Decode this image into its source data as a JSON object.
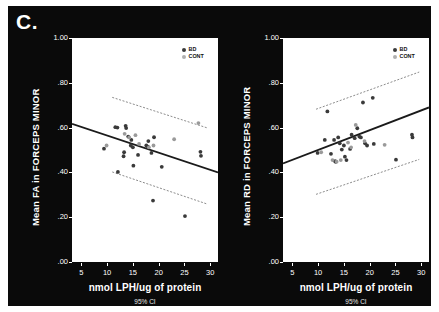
{
  "figure": {
    "panel_letter": "C.",
    "background": "#0a0a0a",
    "plot_background": "#ffffff"
  },
  "legend": {
    "items": [
      {
        "label": "BD",
        "color": "#3a3a3a"
      },
      {
        "label": "CONT",
        "color": "#b0b0b0"
      }
    ]
  },
  "chart_data": [
    {
      "type": "scatter",
      "title": "",
      "xlabel": "nmol LPH/ug of protein",
      "ylabel": "Mean FA in FORCEPS  MINOR",
      "footnote": "95% CI",
      "xlim": [
        3.2,
        31.5
      ],
      "ylim": [
        0.0,
        1.0
      ],
      "xticks": [
        5,
        10,
        15,
        20,
        25,
        30
      ],
      "xticklabels": [
        "5",
        "10",
        "15",
        "20",
        "25",
        "30"
      ],
      "yticks": [
        0.0,
        0.2,
        0.4,
        0.6,
        0.8,
        1.0
      ],
      "yticklabels": [
        ".00",
        ".20",
        ".40",
        ".60",
        ".80",
        "1.00"
      ],
      "grid": false,
      "legend_position": "top-right",
      "fit_line": {
        "x": [
          3.2,
          31.5
        ],
        "y": [
          0.617,
          0.4
        ],
        "color": "#1a1a1a"
      },
      "ci_upper": {
        "x": [
          11.0,
          29.5
        ],
        "y": [
          0.735,
          0.598
        ],
        "color": "#6e6e6e"
      },
      "ci_lower": {
        "x": [
          11.0,
          29.5
        ],
        "y": [
          0.402,
          0.258
        ],
        "color": "#6e6e6e"
      },
      "series": [
        {
          "name": "BD",
          "color": "#3a3a3a",
          "points": [
            [
              9.4,
              0.506
            ],
            [
              11.6,
              0.602
            ],
            [
              12.0,
              0.6
            ],
            [
              12.1,
              0.402
            ],
            [
              13.2,
              0.472
            ],
            [
              13.3,
              0.49
            ],
            [
              13.6,
              0.608
            ],
            [
              13.7,
              0.598
            ],
            [
              14.1,
              0.56
            ],
            [
              14.6,
              0.52
            ],
            [
              14.7,
              0.545
            ],
            [
              15.0,
              0.512
            ],
            [
              15.1,
              0.43
            ],
            [
              16.0,
              0.478
            ],
            [
              17.6,
              0.52
            ],
            [
              17.9,
              0.515
            ],
            [
              18.0,
              0.54
            ],
            [
              18.6,
              0.487
            ],
            [
              18.9,
              0.274
            ],
            [
              19.1,
              0.557
            ],
            [
              20.6,
              0.425
            ],
            [
              25.1,
              0.205
            ],
            [
              28.1,
              0.492
            ],
            [
              28.2,
              0.474
            ]
          ]
        },
        {
          "name": "CONT",
          "color": "#9a9a9a",
          "points": [
            [
              9.9,
              0.52
            ],
            [
              13.4,
              0.572
            ],
            [
              14.3,
              0.556
            ],
            [
              15.5,
              0.566
            ],
            [
              16.2,
              0.527
            ],
            [
              18.1,
              0.512
            ],
            [
              19.0,
              0.52
            ],
            [
              23.0,
              0.548
            ],
            [
              27.7,
              0.62
            ]
          ]
        }
      ]
    },
    {
      "type": "scatter",
      "title": "",
      "xlabel": "nmol LPH/ug of protein",
      "ylabel": "Mean RD in FORCEPS  MINOR",
      "footnote": "95% CI",
      "xlim": [
        3.2,
        31.5
      ],
      "ylim": [
        0.0,
        1.0
      ],
      "xticks": [
        5,
        10,
        15,
        20,
        25,
        30
      ],
      "xticklabels": [
        "5",
        "10",
        "15",
        "20",
        "25",
        "30"
      ],
      "yticks": [
        0.0,
        0.2,
        0.4,
        0.6,
        0.8,
        1.0
      ],
      "yticklabels": [
        ".00",
        ".20",
        ".40",
        ".60",
        ".80",
        "1.00"
      ],
      "grid": false,
      "legend_position": "top-right",
      "fit_line": {
        "x": [
          3.2,
          31.5
        ],
        "y": [
          0.44,
          0.69
        ],
        "color": "#1a1a1a"
      },
      "ci_upper": {
        "x": [
          9.6,
          29.6
        ],
        "y": [
          0.682,
          0.848
        ],
        "color": "#6e6e6e"
      },
      "ci_lower": {
        "x": [
          9.6,
          29.6
        ],
        "y": [
          0.302,
          0.458
        ],
        "color": "#6e6e6e"
      },
      "series": [
        {
          "name": "BD",
          "color": "#3a3a3a",
          "points": [
            [
              9.9,
              0.487
            ],
            [
              11.3,
              0.545
            ],
            [
              11.8,
              0.672
            ],
            [
              12.5,
              0.483
            ],
            [
              13.1,
              0.545
            ],
            [
              13.3,
              0.45
            ],
            [
              13.4,
              0.447
            ],
            [
              13.9,
              0.556
            ],
            [
              14.2,
              0.53
            ],
            [
              14.6,
              0.502
            ],
            [
              15.0,
              0.52
            ],
            [
              15.2,
              0.47
            ],
            [
              15.5,
              0.455
            ],
            [
              16.2,
              0.505
            ],
            [
              16.5,
              0.568
            ],
            [
              17.1,
              0.553
            ],
            [
              17.6,
              0.597
            ],
            [
              18.0,
              0.56
            ],
            [
              18.3,
              0.556
            ],
            [
              18.7,
              0.712
            ],
            [
              19.1,
              0.53
            ],
            [
              19.5,
              0.52
            ],
            [
              20.6,
              0.733
            ],
            [
              20.8,
              0.527
            ],
            [
              25.1,
              0.457
            ],
            [
              28.2,
              0.568
            ],
            [
              28.3,
              0.556
            ]
          ]
        },
        {
          "name": "CONT",
          "color": "#9a9a9a",
          "points": [
            [
              10.6,
              0.49
            ],
            [
              12.8,
              0.455
            ],
            [
              13.6,
              0.448
            ],
            [
              14.4,
              0.455
            ],
            [
              15.8,
              0.533
            ],
            [
              16.4,
              0.512
            ],
            [
              17.3,
              0.612
            ],
            [
              19.0,
              0.54
            ],
            [
              22.9,
              0.523
            ]
          ]
        }
      ]
    }
  ]
}
